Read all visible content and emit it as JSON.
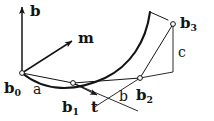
{
  "figure": {
    "background": "#ffffff",
    "stroke_color": "#141414",
    "width": 214,
    "height": 121
  },
  "vectors": {
    "b": {
      "label": "b",
      "name": "vector-b",
      "tail": [
        22,
        73
      ],
      "tip": [
        22,
        7
      ]
    },
    "m": {
      "label": "m",
      "name": "vector-m",
      "tail": [
        22,
        73
      ],
      "tip": [
        72,
        41
      ]
    },
    "t": {
      "label": "t",
      "name": "vector-t",
      "tail": [
        73,
        83
      ],
      "tip": [
        97,
        95
      ]
    }
  },
  "points": [
    {
      "id": "b0",
      "base": "b",
      "sub": "0",
      "x": 22,
      "y": 73,
      "label_x": 4,
      "label_y": 81
    },
    {
      "id": "b1",
      "base": "b",
      "sub": "1",
      "x": 73,
      "y": 83,
      "label_x": 62,
      "label_y": 100
    },
    {
      "id": "b2",
      "base": "b",
      "sub": "2",
      "x": 140,
      "y": 78,
      "label_x": 136,
      "label_y": 88
    },
    {
      "id": "b3",
      "base": "b",
      "sub": "3",
      "x": 173,
      "y": 24,
      "label_x": 180,
      "label_y": 16
    }
  ],
  "segments": [
    {
      "id": "a",
      "label": "a",
      "label_x": 33,
      "label_y": 82
    },
    {
      "id": "b",
      "label": "b",
      "label_x": 119,
      "label_y": 89
    },
    {
      "id": "c",
      "label": "c",
      "label_x": 178,
      "label_y": 45
    }
  ],
  "geometry": {
    "curve": "M 22 73 C 45 92 75 92 105 78 C 130 66 146 42 150 12",
    "control_polygon": "M 22 73 L 73 83 L 140 78 L 173 24",
    "bracket": "M 140 78 L 173 72 L 173 24",
    "cross_line_1": "M 73 83 L 138 111",
    "cross_line_2": "M 140 78 L 93 108",
    "curve_end_tick": "M 150 12 L 168 20"
  }
}
